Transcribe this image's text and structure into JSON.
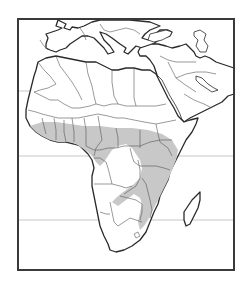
{
  "map": {
    "title": "",
    "region": "Africa, Southern Europe and Middle East",
    "colors": {
      "land": "#ffffff",
      "coastline": "#2a2a2a",
      "borders": "#555555",
      "distribution_range": "#c8c8c8",
      "latitude_lines": "#b8b8b8",
      "frame": "#3a3a3a"
    },
    "latitude_lines": [
      {
        "name": "Tropic of Cancer",
        "y": 91
      },
      {
        "name": "Equator",
        "y": 156
      },
      {
        "name": "Tropic of Capricorn",
        "y": 220
      }
    ],
    "legend": [
      {
        "label": "Distribution range",
        "color": "#c8c8c8"
      }
    ],
    "shaded_region_description": "West African coast (Guinea to Nigeria), Central African belt, East Africa (Uganda, Kenya, Tanzania), Malawi, Zambia, Zimbabwe, Mozambique, eastern South Africa"
  }
}
